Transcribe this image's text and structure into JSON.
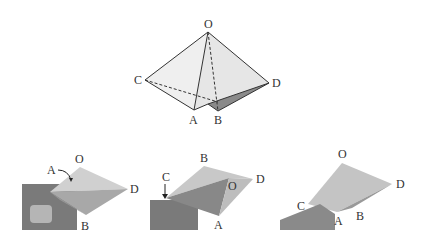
{
  "top_diagram": {
    "labels": {
      "O": "O",
      "C": "C",
      "D": "D",
      "A": "A",
      "B": "B"
    }
  },
  "photos": [
    {
      "labels": {
        "A": "A",
        "O": "O",
        "D": "D",
        "B": "B"
      },
      "annotation": "curved-arrow pointing to A"
    },
    {
      "labels": {
        "B": "B",
        "C": "C",
        "D": "D",
        "O": "O",
        "A": "A"
      },
      "annotation": "down-arrow pointing to C"
    },
    {
      "labels": {
        "O": "O",
        "D": "D",
        "C": "C",
        "A": "A",
        "B": "B"
      }
    }
  ],
  "colors": {
    "face_light": "#ececec",
    "face_mid": "#d8d8d8",
    "face_dark": "#888888",
    "skin": "#8a8a8a",
    "line": "#333333"
  }
}
